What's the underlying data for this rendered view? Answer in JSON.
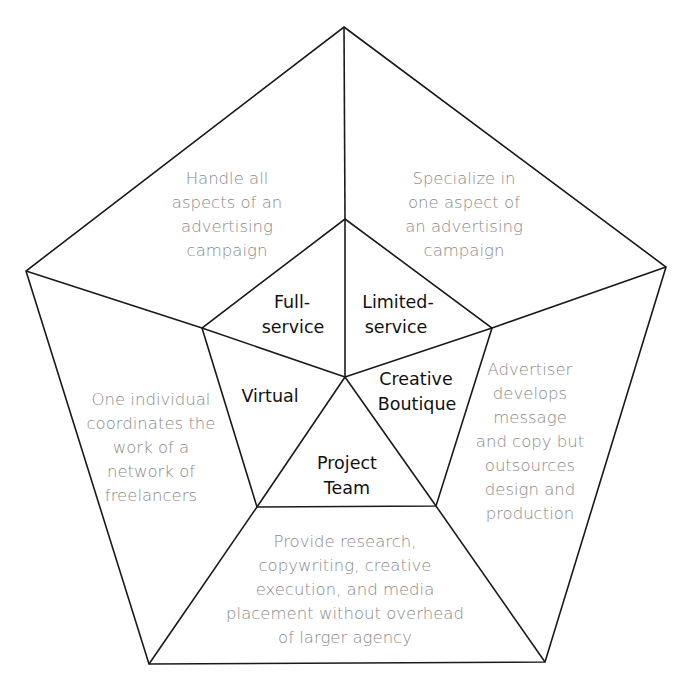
{
  "colors": {
    "line": "#1a1a1a",
    "inner_text": "#111111",
    "outer_text": "#8a8a8a",
    "background": "#ffffff"
  },
  "diagram": {
    "type": "pentagon-segmented",
    "segments": [
      {
        "id": "full-service",
        "label_lines": [
          "Full-",
          "service"
        ],
        "description_lines": [
          "Handle all",
          "aspects of an",
          "advertising",
          "campaign"
        ]
      },
      {
        "id": "limited-service",
        "label_lines": [
          "Limited-",
          "service"
        ],
        "description_lines": [
          "Specialize in",
          "one aspect of",
          "an advertising",
          "campaign"
        ]
      },
      {
        "id": "creative-boutique",
        "label_lines": [
          "Creative",
          "Boutique"
        ],
        "description_lines": [
          "Advertiser",
          "develops",
          "message",
          "and copy but",
          "outsources",
          "design and",
          "production"
        ]
      },
      {
        "id": "project-team",
        "label_lines": [
          "Project",
          "Team"
        ],
        "description_lines": [
          "Provide research,",
          "copywriting, creative",
          "execution, and media",
          "placement without overhead",
          "of larger agency"
        ]
      },
      {
        "id": "virtual",
        "label_lines": [
          "Virtual"
        ],
        "description_lines": [
          "One individual",
          "coordinates the",
          "work of a",
          "network of",
          "freelancers"
        ]
      }
    ]
  }
}
